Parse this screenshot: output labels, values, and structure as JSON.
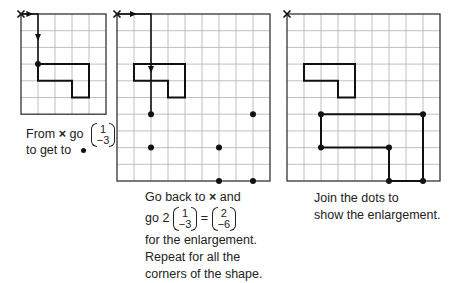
{
  "colors": {
    "grid": "#b0b0b0",
    "border": "#333333",
    "shape": "#111111"
  },
  "panels": [
    {
      "name": "left-grid",
      "cols": 5,
      "rows": 6,
      "origin_label": "×",
      "shape": [
        [
          1,
          3
        ],
        [
          4,
          3
        ],
        [
          4,
          5
        ],
        [
          3,
          5
        ],
        [
          3,
          4
        ],
        [
          1,
          4
        ]
      ],
      "path": [
        [
          0,
          0
        ],
        [
          1,
          0
        ],
        [
          1,
          3
        ]
      ],
      "dots": [
        [
          1,
          3
        ]
      ]
    },
    {
      "name": "middle-grid",
      "cols": 9,
      "rows": 10,
      "origin_label": "×",
      "shape": [
        [
          1,
          3
        ],
        [
          4,
          3
        ],
        [
          4,
          5
        ],
        [
          3,
          5
        ],
        [
          3,
          4
        ],
        [
          1,
          4
        ]
      ],
      "path": [
        [
          0,
          0
        ],
        [
          2,
          0
        ],
        [
          2,
          6
        ]
      ],
      "dots": [
        [
          2,
          6
        ],
        [
          8,
          6
        ],
        [
          2,
          8
        ],
        [
          6,
          8
        ],
        [
          6,
          10
        ],
        [
          8,
          10
        ]
      ]
    },
    {
      "name": "right-grid",
      "cols": 9,
      "rows": 10,
      "origin_label": "×",
      "shape": [
        [
          1,
          3
        ],
        [
          4,
          3
        ],
        [
          4,
          5
        ],
        [
          3,
          5
        ],
        [
          3,
          4
        ],
        [
          1,
          4
        ]
      ],
      "enlarged_shape": [
        [
          2,
          6
        ],
        [
          8,
          6
        ],
        [
          8,
          10
        ],
        [
          6,
          10
        ],
        [
          6,
          8
        ],
        [
          2,
          8
        ]
      ],
      "dots": [
        [
          2,
          6
        ],
        [
          8,
          6
        ],
        [
          8,
          10
        ],
        [
          6,
          10
        ],
        [
          6,
          8
        ],
        [
          2,
          8
        ]
      ]
    }
  ],
  "captions": {
    "left": {
      "line1_pre": "From",
      "cross": "×",
      "line1_post": "go",
      "vec_top": "1",
      "vec_bottom": "−3",
      "line2": "to get to"
    },
    "middle": {
      "line1_pre": "Go back to",
      "cross": "×",
      "line1_post": "and",
      "line2_pre": "go 2",
      "vec1_top": "1",
      "vec1_bottom": "−3",
      "equals": "=",
      "vec2_top": "2",
      "vec2_bottom": "−6",
      "line3": "for the enlargement.",
      "line4": "Repeat for all the",
      "line5": "corners of the shape."
    },
    "right": {
      "line1": "Join the dots to",
      "line2": "show the enlargement."
    }
  }
}
